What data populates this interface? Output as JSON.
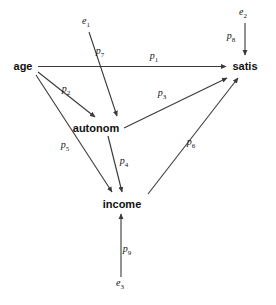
{
  "diagram": {
    "type": "path-diagram",
    "title": "",
    "background_color": "#ffffff",
    "line_color": "#3a3a3a",
    "text_color": "#111111",
    "width": 276,
    "height": 305,
    "nodes": [
      {
        "id": "age",
        "label": "age",
        "x": 23,
        "y": 66,
        "kind": "observed"
      },
      {
        "id": "autonom",
        "label": "autonom",
        "x": 96,
        "y": 128,
        "kind": "observed"
      },
      {
        "id": "income",
        "label": "income",
        "x": 122,
        "y": 204,
        "kind": "observed"
      },
      {
        "id": "satis",
        "label": "satis",
        "x": 245,
        "y": 66,
        "kind": "observed"
      }
    ],
    "errors": [
      {
        "id": "e1",
        "label": "e",
        "subscript": "1",
        "x": 86,
        "y": 24,
        "target": "autonom"
      },
      {
        "id": "e2",
        "label": "e",
        "subscript": "2",
        "x": 243,
        "y": 15,
        "target": "satis"
      },
      {
        "id": "e3",
        "label": "e",
        "subscript": "3",
        "x": 120,
        "y": 285,
        "target": "income"
      }
    ],
    "paths": [
      {
        "id": "p1",
        "label": "p",
        "subscript": "1",
        "from": "age",
        "to": "satis",
        "label_x": 154,
        "label_y": 57
      },
      {
        "id": "p2",
        "label": "p",
        "subscript": "2",
        "from": "age",
        "to": "autonom",
        "label_x": 66,
        "label_y": 90
      },
      {
        "id": "p3",
        "label": "p",
        "subscript": "3",
        "from": "autonom",
        "to": "satis",
        "label_x": 162,
        "label_y": 94
      },
      {
        "id": "p4",
        "label": "p",
        "subscript": "4",
        "from": "autonom",
        "to": "income",
        "label_x": 124,
        "label_y": 162
      },
      {
        "id": "p5",
        "label": "p",
        "subscript": "5",
        "from": "age",
        "to": "income",
        "label_x": 65,
        "label_y": 146
      },
      {
        "id": "p6",
        "label": "p",
        "subscript": "6",
        "from": "income",
        "to": "satis",
        "label_x": 191,
        "label_y": 143
      },
      {
        "id": "p7",
        "label": "p",
        "subscript": "7",
        "from": "e1",
        "to": "autonom",
        "label_x": 100,
        "label_y": 52
      },
      {
        "id": "p8",
        "label": "p",
        "subscript": "8",
        "from": "e2",
        "to": "satis",
        "label_x": 231,
        "label_y": 37
      },
      {
        "id": "p9",
        "label": "p",
        "subscript": "9",
        "from": "e3",
        "to": "income",
        "label_x": 127,
        "label_y": 250
      }
    ]
  }
}
